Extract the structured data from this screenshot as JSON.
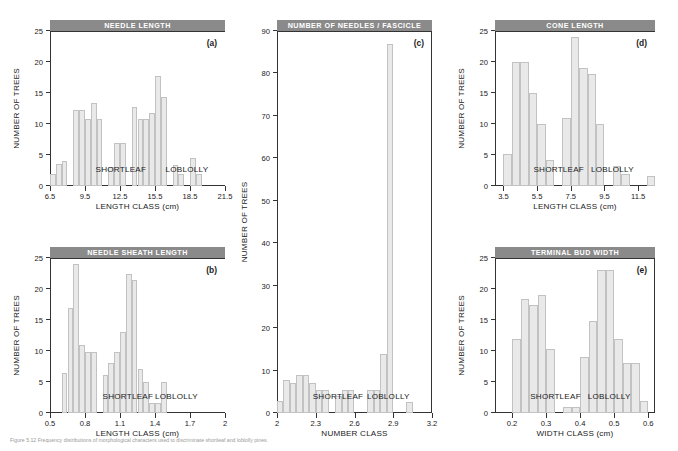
{
  "figure": {
    "caption": "Figure 5.12   Frequency distributions of morphological characters used to discriminate shortleaf and loblolly pines.",
    "ylabel": "NUMBER OF TREES",
    "species_left": "SHORTLEAF",
    "species_right": "LOBLOLLY",
    "banner_color": "#8a8a8a",
    "bar_fill": "#e9e9e9",
    "bar_stroke": "#c2c2c2",
    "axis_color": "#333333"
  },
  "chart_data": [
    {
      "id": "a",
      "type": "bar",
      "title": "NEEDLE LENGTH",
      "panel_letter": "(a)",
      "xlabel": "LENGTH CLASS (cm)",
      "ylabel": "NUMBER OF TREES",
      "xlim": [
        6.5,
        21.5
      ],
      "ylim": [
        0,
        25
      ],
      "yticks": [
        0,
        5,
        10,
        15,
        20,
        25
      ],
      "xticks": [
        6.5,
        9.5,
        12.5,
        15.5,
        18.5,
        21.5
      ],
      "bin_width": 0.5,
      "grid": false,
      "annotations": [
        "SHORTLEAF",
        "LOBLOLLY"
      ],
      "bins": [
        6.5,
        7.0,
        7.5,
        8.0,
        8.5,
        9.0,
        9.5,
        10.0,
        10.5,
        11.0,
        11.5,
        12.0,
        12.5,
        13.0,
        13.5,
        14.0,
        14.5,
        15.0,
        15.5,
        16.0,
        16.5,
        17.0,
        17.5,
        18.0,
        18.5,
        19.0,
        19.5,
        20.0,
        20.5
      ],
      "values": [
        2,
        3.5,
        4,
        0,
        12.2,
        12.2,
        10.8,
        13.4,
        10.8,
        0,
        3,
        7,
        7,
        0,
        12.8,
        10.8,
        10.8,
        11.8,
        17.7,
        14.4,
        0,
        3.4,
        2,
        0,
        4.5,
        2
      ]
    },
    {
      "id": "b",
      "type": "bar",
      "title": "NEEDLE SHEATH LENGTH",
      "panel_letter": "(b)",
      "xlabel": "LENGTH CLASS (cm)",
      "ylabel": "NUMBER OF TREES",
      "xlim": [
        0.5,
        2.0
      ],
      "ylim": [
        0,
        25
      ],
      "yticks": [
        0,
        5,
        10,
        15,
        20,
        25
      ],
      "xticks": [
        0.5,
        0.8,
        1.1,
        1.4,
        1.7,
        2.0
      ],
      "bin_width": 0.05,
      "grid": false,
      "annotations": [
        "SHORTLEAF",
        "LOBLOLLY"
      ],
      "bins": [
        0.6,
        0.65,
        0.7,
        0.75,
        0.8,
        0.85,
        0.9,
        0.95,
        1.0,
        1.05,
        1.1,
        1.15,
        1.2,
        1.25,
        1.3,
        1.35,
        1.4,
        1.45,
        1.5,
        1.55,
        1.6,
        1.65,
        1.7,
        1.75,
        1.8
      ],
      "values": [
        6.5,
        17,
        24,
        11,
        9.8,
        9.8,
        0,
        6.2,
        8.1,
        9.8,
        13,
        22.5,
        21.5,
        7.1,
        5,
        1.6,
        1.6,
        5
      ]
    },
    {
      "id": "c",
      "type": "bar",
      "title": "NUMBER OF NEEDLES / FASCICLE",
      "panel_letter": "(c)",
      "xlabel": "NUMBER CLASS",
      "ylabel": "NUMBER OF TREES",
      "xlim": [
        2.0,
        3.2
      ],
      "ylim": [
        0,
        90
      ],
      "yticks": [
        0,
        10,
        20,
        30,
        40,
        50,
        60,
        70,
        80,
        90
      ],
      "xticks": [
        2.0,
        2.3,
        2.6,
        2.9,
        3.2
      ],
      "bin_width": 0.05,
      "grid": false,
      "annotations": [
        "SHORTLEAF",
        "LOBLOLLY"
      ],
      "bins": [
        2.0,
        2.05,
        2.1,
        2.15,
        2.2,
        2.25,
        2.3,
        2.35,
        2.4,
        2.45,
        2.5,
        2.55,
        2.6,
        2.65,
        2.7,
        2.75,
        2.8,
        2.85,
        2.9,
        2.95,
        3.0,
        3.05,
        3.1
      ],
      "values": [
        2.8,
        7.8,
        7,
        9,
        9,
        7,
        5.5,
        5.5,
        0,
        4,
        5.5,
        5.5,
        0,
        0,
        5.5,
        5.5,
        14,
        87,
        0,
        0,
        2.6
      ]
    },
    {
      "id": "d",
      "type": "bar",
      "title": "CONE LENGTH",
      "panel_letter": "(d)",
      "xlabel": "LENGTH CLASS (cm)",
      "ylabel": "NUMBER OF TREES",
      "xlim": [
        3.0,
        12.5
      ],
      "ylim": [
        0,
        25
      ],
      "yticks": [
        0,
        5,
        10,
        15,
        20,
        25
      ],
      "xticks": [
        3.5,
        5.5,
        7.5,
        9.5,
        11.5
      ],
      "bin_width": 0.5,
      "grid": false,
      "annotations": [
        "SHORTLEAF",
        "LOBLOLLY"
      ],
      "bins": [
        3.5,
        4.0,
        4.5,
        5.0,
        5.5,
        6.0,
        6.5,
        7.0,
        7.5,
        8.0,
        8.5,
        9.0,
        9.5,
        10.0,
        10.5,
        11.0,
        11.5,
        12.0
      ],
      "values": [
        5.2,
        20,
        20,
        15,
        10,
        4.2,
        0,
        11,
        24,
        19,
        18,
        10,
        0,
        3.2,
        2,
        0,
        0,
        1.6
      ]
    },
    {
      "id": "e",
      "type": "bar",
      "title": "TERMINAL BUD WIDTH",
      "panel_letter": "(e)",
      "xlabel": "WIDTH CLASS (cm)",
      "ylabel": "NUMBER OF TREES",
      "xlim": [
        0.15,
        0.62
      ],
      "ylim": [
        0,
        25
      ],
      "yticks": [
        0,
        5,
        10,
        15,
        20,
        25
      ],
      "xticks": [
        0.2,
        0.3,
        0.4,
        0.5,
        0.6
      ],
      "bin_width": 0.025,
      "grid": false,
      "annotations": [
        "SHORTLEAF",
        "LOBLOLLY"
      ],
      "bins": [
        0.2,
        0.225,
        0.25,
        0.275,
        0.3,
        0.325,
        0.35,
        0.375,
        0.4,
        0.425,
        0.45,
        0.475,
        0.5,
        0.525,
        0.55,
        0.575
      ],
      "values": [
        12,
        18.4,
        17.5,
        19,
        10.4,
        0,
        0.9,
        0.9,
        9,
        14.8,
        23,
        23,
        12,
        8,
        8,
        2,
        0.9
      ]
    }
  ]
}
